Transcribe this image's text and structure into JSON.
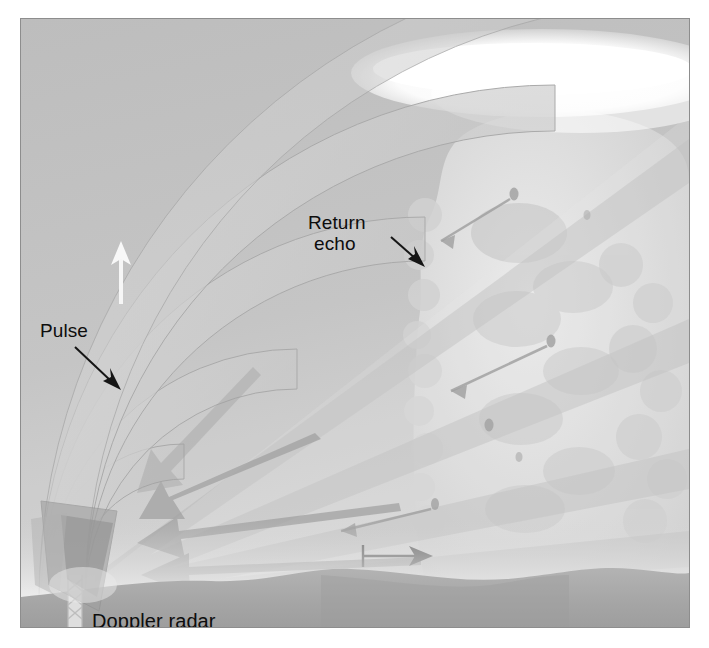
{
  "figure": {
    "type": "illustration-diagram",
    "frame": {
      "border_color": "#8d8d8d",
      "background_color": "#bcbcbc",
      "page_background": "#ffffff"
    }
  },
  "labels": {
    "pulse": "Pulse",
    "return_echo_line1": "Return",
    "return_echo_line2": "echo",
    "doppler_radar": "Doppler radar"
  },
  "colors": {
    "sky": "#bdbdbd",
    "sky_light": "#cfcfcf",
    "cloud_anvil": "#ffffff",
    "cloud_body": "#dcdcdc",
    "cloud_shadow": "#c2c2c2",
    "ground": "#a6a6a6",
    "ground_haze": "#f2f2f2",
    "wave_band": "#cfcfcf",
    "wave_band_edge": "#aaaaaa",
    "beam": "#b0b0b0",
    "echo_arrow": "#9a9a9a",
    "label_text": "#0d0d0d",
    "arrow_black": "#111111",
    "arrow_white": "#f4f4f4",
    "raindrop": "#999999",
    "dish": "#9d9d9d",
    "tower": "#d8d8d8"
  },
  "scene_elements": {
    "radar_dish": {
      "name": "Doppler radar parabolic dish antenna",
      "position": "bottom-left"
    },
    "radar_tower": {
      "name": "lattice support tower",
      "position": "bottom-left"
    },
    "pulse_wavefronts": {
      "name": "concentric outgoing radar pulse arcs",
      "count": 5,
      "description": "translucent light arc bands radiating from the radar"
    },
    "transmitted_beams": {
      "name": "outgoing radar beam rays",
      "count": 4
    },
    "return_echo_arrows": {
      "name": "thick arrows returning toward the radar dish",
      "count": 3,
      "direction": "toward lower-left"
    },
    "storm_cloud": {
      "name": "cumulonimbus thunderstorm with anvil top",
      "position": "right"
    },
    "raindrops": {
      "name": "falling raindrops with motion arrows inside the storm",
      "count": 6
    },
    "motion_arrow_left_up": {
      "name": "white upward motion arrow",
      "direction": "up"
    },
    "motion_arrow_bottom_right": {
      "name": "dark rightward motion arrow",
      "direction": "right"
    },
    "terrain": {
      "name": "rolling hills horizon silhouette"
    },
    "pointer_arrows": [
      {
        "name": "pulse-pointer",
        "from": "Pulse label",
        "direction": "down-right"
      },
      {
        "name": "return-echo-pointer",
        "from": "Return echo label",
        "direction": "down-right"
      }
    ]
  }
}
